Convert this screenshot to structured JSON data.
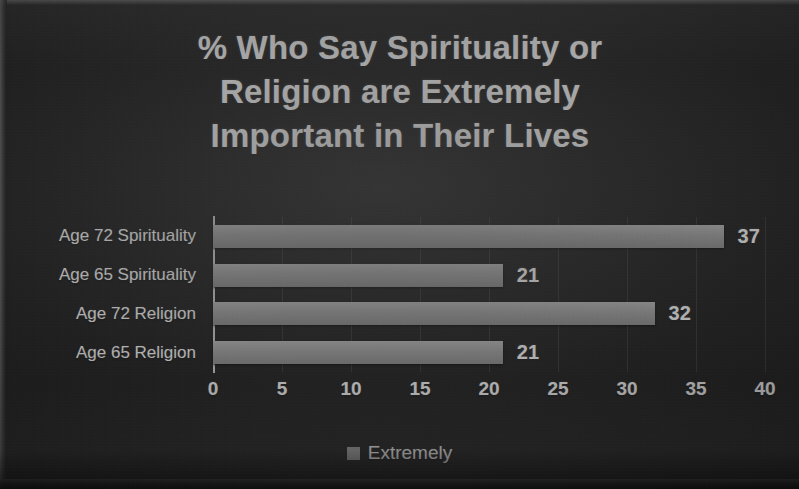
{
  "chart_data": {
    "type": "bar",
    "orientation": "horizontal",
    "title": "% Who Say Spirituality or Religion are Extremely Important in Their Lives",
    "title_lines": [
      "% Who Say Spirituality or",
      "Religion are Extremely",
      "Important in Their Lives"
    ],
    "categories": [
      "Age 72 Spirituality",
      "Age 65 Spirituality",
      "Age 72 Religion",
      "Age 65 Religion"
    ],
    "values": [
      37,
      21,
      32,
      21
    ],
    "data_labels": [
      "37",
      "21",
      "32",
      "21"
    ],
    "series": [
      {
        "name": "Extremely",
        "values": [
          37,
          21,
          32,
          21
        ],
        "color": "#9a9a9a"
      }
    ],
    "xlabel": "",
    "ylabel": "",
    "xlim": [
      0,
      40
    ],
    "xticks": [
      0,
      5,
      10,
      15,
      20,
      25,
      30,
      35,
      40
    ],
    "xtick_labels": [
      "0",
      "5",
      "10",
      "15",
      "20",
      "25",
      "30",
      "35",
      "40"
    ],
    "grid": true,
    "grid_axis": "x",
    "legend": {
      "position": "bottom",
      "entries": [
        "Extremely"
      ]
    },
    "background_color": "#1b1b1b",
    "text_color": "#f2f2f2",
    "bar_color": "#9a9a9a"
  },
  "legend": {
    "label": "Extremely"
  }
}
